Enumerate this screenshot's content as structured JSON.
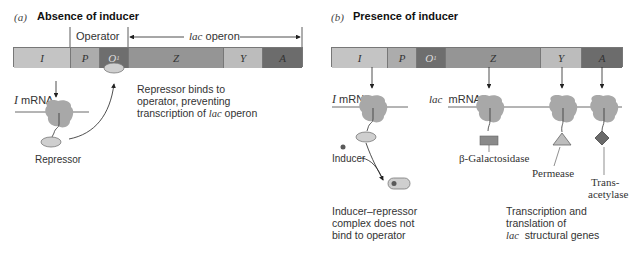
{
  "panel_a": {
    "letter": "(a)",
    "title": "Absence of inducer",
    "operator_label": "Operator",
    "operon_label_italic": "lac",
    "operon_label_rest": " operon",
    "genes": [
      {
        "id": "I",
        "label": "I",
        "color": "#c4c4c4"
      },
      {
        "id": "P",
        "label": "P",
        "color": "#acacac"
      },
      {
        "id": "O1",
        "label": "O",
        "sub": "1",
        "color": "#6e6e6e"
      },
      {
        "id": "Z",
        "label": "Z",
        "color": "#959595"
      },
      {
        "id": "Y",
        "label": "Y",
        "color": "#bcbcbc"
      },
      {
        "id": "A",
        "label": "A",
        "color": "#6c6c6c"
      }
    ],
    "mrna_label_italic": "I",
    "mrna_label_rest": " mRNA",
    "repressor_label": "Repressor",
    "note_lines": [
      "Repressor binds to",
      "operator, preventing",
      "transcription of "
    ],
    "note_italic": "lac",
    "note_tail": " operon"
  },
  "panel_b": {
    "letter": "(b)",
    "title": "Presence of inducer",
    "genes": [
      {
        "id": "I",
        "label": "I"
      },
      {
        "id": "P",
        "label": "P"
      },
      {
        "id": "O1",
        "label": "O",
        "sub": "1"
      },
      {
        "id": "Z",
        "label": "Z"
      },
      {
        "id": "Y",
        "label": "Y"
      },
      {
        "id": "A",
        "label": "A"
      }
    ],
    "i_mrna_italic": "I",
    "i_mrna_rest": " mRNA",
    "lac_mrna_italic": "lac",
    "lac_mrna_rest": "  mRNA",
    "inducer_label": "Inducer",
    "products": [
      "β-Galactosidase",
      "Permease",
      "Trans-",
      "acetylase"
    ],
    "complex_note": [
      "Inducer–repressor",
      "complex does not",
      "bind to operator"
    ],
    "transcription_note": [
      "Transcription and",
      "translation of"
    ],
    "transcription_italic": "lac",
    "transcription_tail": "  structural genes"
  },
  "colors": {
    "ribosome": "#a8a8a8",
    "repressor": "#cfcfcf",
    "inducer": "#5a5a5a",
    "galactosidase": "#8a8a8a",
    "permease": "#bdbdbd",
    "transacetylase": "#6a6a6a",
    "line": "#333333"
  }
}
